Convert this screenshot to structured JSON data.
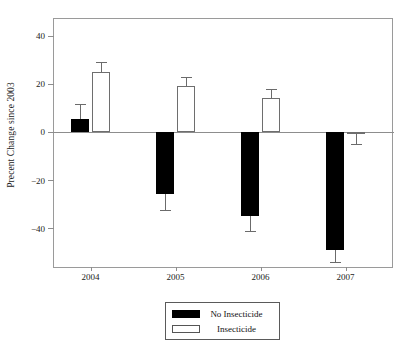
{
  "chart_data": {
    "type": "bar",
    "title": "",
    "subtitle": "",
    "xlabel": "",
    "ylabel": "Precent Change since 2003",
    "categories": [
      "2004",
      "2005",
      "2006",
      "2007"
    ],
    "ylim": [
      -57,
      47
    ],
    "yticks": [
      40,
      20,
      0,
      -20,
      -40
    ],
    "ytick_labels": [
      "40",
      "20",
      "0",
      "−20",
      "−40"
    ],
    "grid": false,
    "legend_position": "bottom-center",
    "zero_line": true,
    "series": [
      {
        "name": "No Insecticide",
        "color": "#000000",
        "fill": "solid",
        "values": [
          5.5,
          -26.0,
          -35.0,
          -49.0
        ],
        "errors": [
          6.0,
          6.5,
          6.0,
          5.0
        ]
      },
      {
        "name": "Insecticide",
        "color": "#ffffff",
        "fill": "hollow",
        "values": [
          25.0,
          19.0,
          14.0,
          -1.0
        ],
        "errors": [
          4.0,
          4.0,
          4.0,
          4.0
        ]
      }
    ]
  },
  "legend": {
    "entries": [
      {
        "label": "No Insecticide",
        "swatch": "filled-black-swatch"
      },
      {
        "label": "Insecticide",
        "swatch": "hollow-white-swatch"
      }
    ]
  },
  "axes": {
    "y_title": "Precent Change since 2003",
    "y_tick_labels": [
      "40",
      "20",
      "0",
      "−20",
      "−40"
    ],
    "x_tick_labels": [
      "2004",
      "2005",
      "2006",
      "2007"
    ]
  }
}
